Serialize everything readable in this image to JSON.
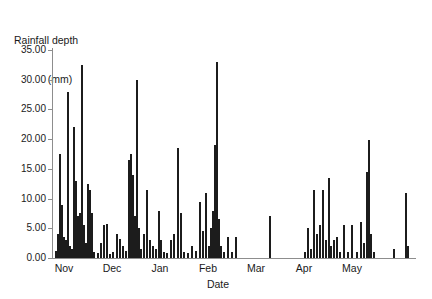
{
  "chart_data": {
    "type": "bar",
    "title": "",
    "ylabel_line1": "Rainfall depth",
    "ylabel_line2": "(mm)",
    "xlabel": "Date",
    "ylim": [
      0,
      35
    ],
    "ytick_labels": [
      "0.00",
      "5.00",
      "10.00",
      "15.00",
      "20.00",
      "25.00",
      "30.00",
      "35.00"
    ],
    "ytick_values": [
      0,
      5,
      10,
      15,
      20,
      25,
      30,
      35
    ],
    "xtick_labels": [
      "Nov",
      "Dec",
      "Jan",
      "Feb",
      "Mar",
      "Apr",
      "May"
    ],
    "xtick_positions": [
      11,
      59,
      107,
      155,
      203,
      251,
      299
    ],
    "xlim": [
      0,
      362
    ],
    "grid": false,
    "legend": null,
    "bar_color": "#1c1c1c",
    "axis_color": "#8d8d8d",
    "x_unit_label": "days (Nov - May)",
    "bars": [
      {
        "x": 2,
        "v": 1.2
      },
      {
        "x": 4,
        "v": 4.0
      },
      {
        "x": 6,
        "v": 17.5
      },
      {
        "x": 8,
        "v": 9.0
      },
      {
        "x": 10,
        "v": 3.5
      },
      {
        "x": 12,
        "v": 3.0
      },
      {
        "x": 14,
        "v": 28.0
      },
      {
        "x": 16,
        "v": 2.0
      },
      {
        "x": 18,
        "v": 1.5
      },
      {
        "x": 20,
        "v": 22.0
      },
      {
        "x": 22,
        "v": 13.0
      },
      {
        "x": 24,
        "v": 7.0
      },
      {
        "x": 26,
        "v": 7.5
      },
      {
        "x": 28,
        "v": 32.5
      },
      {
        "x": 30,
        "v": 5.5
      },
      {
        "x": 32,
        "v": 2.5
      },
      {
        "x": 34,
        "v": 12.5
      },
      {
        "x": 36,
        "v": 11.5
      },
      {
        "x": 38,
        "v": 7.5
      },
      {
        "x": 40,
        "v": 1.0
      },
      {
        "x": 44,
        "v": 0.8
      },
      {
        "x": 47,
        "v": 2.6
      },
      {
        "x": 50,
        "v": 5.5
      },
      {
        "x": 53,
        "v": 5.8
      },
      {
        "x": 56,
        "v": 0.6
      },
      {
        "x": 59,
        "v": 1.0
      },
      {
        "x": 63,
        "v": 4.0
      },
      {
        "x": 66,
        "v": 3.2
      },
      {
        "x": 69,
        "v": 2.0
      },
      {
        "x": 72,
        "v": 1.2
      },
      {
        "x": 75,
        "v": 16.5
      },
      {
        "x": 77,
        "v": 17.5
      },
      {
        "x": 79,
        "v": 14.0
      },
      {
        "x": 81,
        "v": 7.0
      },
      {
        "x": 83,
        "v": 30.0
      },
      {
        "x": 85,
        "v": 5.0
      },
      {
        "x": 87,
        "v": 1.5
      },
      {
        "x": 90,
        "v": 4.0
      },
      {
        "x": 93,
        "v": 11.5
      },
      {
        "x": 96,
        "v": 3.0
      },
      {
        "x": 99,
        "v": 2.0
      },
      {
        "x": 102,
        "v": 1.5
      },
      {
        "x": 105,
        "v": 8.0
      },
      {
        "x": 107,
        "v": 3.0
      },
      {
        "x": 110,
        "v": 1.0
      },
      {
        "x": 113,
        "v": 0.8
      },
      {
        "x": 117,
        "v": 3.0
      },
      {
        "x": 120,
        "v": 4.0
      },
      {
        "x": 124,
        "v": 18.5
      },
      {
        "x": 127,
        "v": 7.5
      },
      {
        "x": 130,
        "v": 1.0
      },
      {
        "x": 134,
        "v": 0.8
      },
      {
        "x": 138,
        "v": 2.0
      },
      {
        "x": 142,
        "v": 1.2
      },
      {
        "x": 146,
        "v": 9.5
      },
      {
        "x": 149,
        "v": 4.5
      },
      {
        "x": 152,
        "v": 11.0
      },
      {
        "x": 155,
        "v": 2.0
      },
      {
        "x": 157,
        "v": 5.0
      },
      {
        "x": 159,
        "v": 8.0
      },
      {
        "x": 161,
        "v": 19.0
      },
      {
        "x": 163,
        "v": 33.0
      },
      {
        "x": 165,
        "v": 6.5
      },
      {
        "x": 167,
        "v": 2.0
      },
      {
        "x": 170,
        "v": 1.0
      },
      {
        "x": 174,
        "v": 3.5
      },
      {
        "x": 178,
        "v": 1.0
      },
      {
        "x": 182,
        "v": 3.5
      },
      {
        "x": 216,
        "v": 7.0
      },
      {
        "x": 251,
        "v": 1.0
      },
      {
        "x": 254,
        "v": 5.0
      },
      {
        "x": 257,
        "v": 1.5
      },
      {
        "x": 260,
        "v": 11.5
      },
      {
        "x": 263,
        "v": 4.0
      },
      {
        "x": 266,
        "v": 5.5
      },
      {
        "x": 269,
        "v": 11.5
      },
      {
        "x": 272,
        "v": 3.0
      },
      {
        "x": 275,
        "v": 13.5
      },
      {
        "x": 277,
        "v": 2.0
      },
      {
        "x": 280,
        "v": 3.0
      },
      {
        "x": 283,
        "v": 3.5
      },
      {
        "x": 286,
        "v": 1.0
      },
      {
        "x": 290,
        "v": 5.5
      },
      {
        "x": 294,
        "v": 1.0
      },
      {
        "x": 298,
        "v": 5.5
      },
      {
        "x": 303,
        "v": 1.0
      },
      {
        "x": 307,
        "v": 6.0
      },
      {
        "x": 310,
        "v": 2.5
      },
      {
        "x": 313,
        "v": 14.5
      },
      {
        "x": 315,
        "v": 19.8
      },
      {
        "x": 317,
        "v": 4.0
      },
      {
        "x": 320,
        "v": 1.0
      },
      {
        "x": 340,
        "v": 1.5
      },
      {
        "x": 352,
        "v": 11.0
      },
      {
        "x": 354,
        "v": 2.0
      }
    ]
  }
}
